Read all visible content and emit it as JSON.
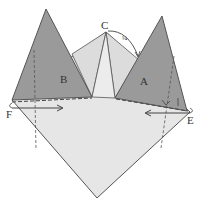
{
  "diagram": {
    "type": "origami-fold-step",
    "labels": {
      "A": "A",
      "B": "B",
      "C": "C",
      "E": "E",
      "F": "F",
      "fraction": "¼"
    },
    "colors": {
      "flap_dark": "#9a9a9a",
      "paper_light": "#e4e4e4",
      "paper_mid": "#d6d6d6",
      "line": "#555555",
      "background": "#ffffff"
    },
    "elements": [
      {
        "id": "base-kite",
        "desc": "Light gray base shape from C down to F, bottom point and E"
      },
      {
        "id": "flap-B",
        "desc": "Dark gray triangular flap on the left, labeled B"
      },
      {
        "id": "flap-A",
        "desc": "Dark gray triangular flap on the right, labeled A"
      },
      {
        "id": "arrow-F",
        "desc": "Arrow from F pointing right"
      },
      {
        "id": "arrow-E",
        "desc": "Arrow from E pointing left"
      },
      {
        "id": "rotate-arrow-C",
        "desc": "Curved arrow near C with ¼ marking"
      }
    ]
  }
}
